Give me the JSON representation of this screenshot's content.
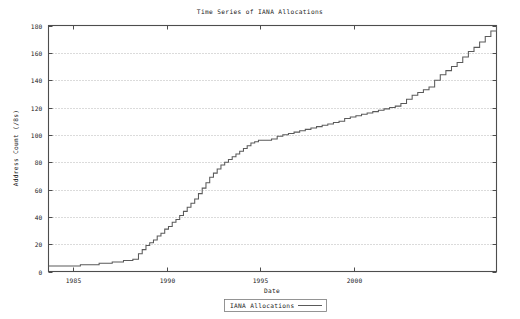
{
  "figure": {
    "width": 520,
    "height": 319,
    "background_color": "#ffffff",
    "foreground_color": "#1a1a1a",
    "frame_color": "#4d4d4d",
    "grid_color": "#9a9a9a",
    "series_color": "#5a5a5a"
  },
  "chart_data": {
    "type": "line",
    "title": "Time Series of IANA Allocations",
    "xlabel": "Date",
    "ylabel": "Address Count (/8s)",
    "grid": true,
    "grid_axis": "y",
    "legend_position": "bottom-center",
    "xlim": [
      1983.7,
      2007.6
    ],
    "ylim": [
      0,
      180
    ],
    "xticks": [
      1985,
      1990,
      1995,
      2000
    ],
    "xtick_labels": [
      "1985",
      "1990",
      "1995",
      "2000"
    ],
    "yticks": [
      0,
      20,
      40,
      60,
      80,
      100,
      120,
      140,
      160,
      180
    ],
    "ytick_labels": [
      "0",
      "20",
      "40",
      "60",
      "80",
      "100",
      "120",
      "140",
      "160",
      "180"
    ],
    "series": [
      {
        "name": "IANA Allocations",
        "style": "step",
        "x": [
          1983.7,
          1984.3,
          1984.9,
          1985.4,
          1985.9,
          1986.4,
          1986.8,
          1987.1,
          1987.4,
          1987.7,
          1988.0,
          1988.2,
          1988.5,
          1988.7,
          1988.9,
          1989.1,
          1989.3,
          1989.5,
          1989.7,
          1989.9,
          1990.1,
          1990.3,
          1990.5,
          1990.7,
          1990.9,
          1991.1,
          1991.3,
          1991.5,
          1991.7,
          1991.9,
          1992.1,
          1992.3,
          1992.5,
          1992.7,
          1992.9,
          1993.1,
          1993.3,
          1993.5,
          1993.7,
          1993.9,
          1994.1,
          1994.3,
          1994.5,
          1994.7,
          1994.9,
          1995.1,
          1995.3,
          1995.6,
          1995.9,
          1996.2,
          1996.5,
          1996.8,
          1997.1,
          1997.4,
          1997.7,
          1998.0,
          1998.3,
          1998.6,
          1998.9,
          1999.2,
          1999.5,
          1999.8,
          2000.1,
          2000.4,
          2000.7,
          2001.0,
          2001.3,
          2001.6,
          2001.9,
          2002.2,
          2002.5,
          2002.8,
          2003.1,
          2003.4,
          2003.7,
          2004.0,
          2004.3,
          2004.6,
          2004.9,
          2005.2,
          2005.5,
          2005.8,
          2006.1,
          2006.4,
          2006.7,
          2007.0,
          2007.3,
          2007.6
        ],
        "y": [
          4,
          4,
          4,
          5,
          5,
          6,
          6,
          7,
          7,
          8,
          8,
          9,
          13,
          16,
          19,
          21,
          23,
          26,
          28,
          31,
          33,
          36,
          38,
          41,
          44,
          47,
          50,
          53,
          57,
          61,
          65,
          69,
          72,
          75,
          78,
          80,
          82,
          84,
          86,
          88,
          90,
          92,
          94,
          95,
          96,
          96,
          96,
          97,
          99,
          100,
          101,
          102,
          103,
          104,
          105,
          106,
          107,
          108,
          109,
          110,
          112,
          113,
          114,
          115,
          116,
          117,
          118,
          119,
          120,
          121,
          123,
          126,
          129,
          131,
          133,
          135,
          140,
          144,
          147,
          150,
          153,
          157,
          161,
          164,
          168,
          172,
          176,
          180
        ]
      }
    ],
    "annotations": []
  },
  "legend": {
    "entries": [
      {
        "label": "IANA Allocations",
        "marker": "line"
      }
    ]
  }
}
